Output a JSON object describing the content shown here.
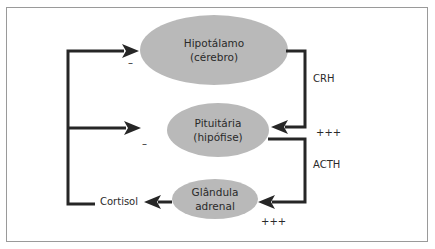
{
  "diagram": {
    "nodes": [
      {
        "id": "hipotalamo",
        "line1": "Hipotálamo",
        "line2": "(cérebro)"
      },
      {
        "id": "pituitaria",
        "line1": "Pituitária",
        "line2": "(hipófise)"
      },
      {
        "id": "adrenal",
        "line1": "Glândula",
        "line2": "adrenal"
      }
    ],
    "edges": [
      {
        "from": "hipotalamo",
        "to": "pituitaria",
        "label": "CRH",
        "effect": "+++"
      },
      {
        "from": "pituitaria",
        "to": "adrenal",
        "label": "ACTH",
        "effect": "+++"
      },
      {
        "from": "adrenal",
        "to": "cortisol",
        "label": ""
      },
      {
        "from": "cortisol",
        "to": "hipotalamo",
        "effect": "–"
      },
      {
        "from": "cortisol",
        "to": "pituitaria",
        "effect": "–"
      }
    ],
    "labels": {
      "cortisol": "Cortisol",
      "crh": "CRH",
      "acth": "ACTH",
      "plus_crh": "+++",
      "plus_acth": "+++",
      "minus_hipotalamo": "–",
      "minus_pituitaria": "–"
    },
    "colors": {
      "node_fill": "#b9b9b9",
      "line": "#262626",
      "frame": "#9a9a9a"
    }
  }
}
